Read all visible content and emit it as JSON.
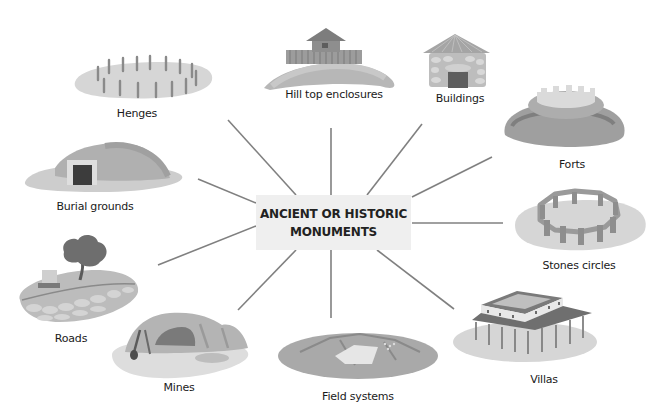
{
  "diagram": {
    "type": "spider-diagram",
    "center": {
      "line1": "ANCIENT OR HISTORIC",
      "line2": "MONUMENTS"
    },
    "colors": {
      "center_fill": "#efefef",
      "connector": "#808080",
      "ground_light": "#d9d9d9",
      "ground_mid": "#bdbdbd",
      "ground_dark": "#8c8c8c",
      "dark_accent": "#4a4a4a"
    },
    "nodes": [
      {
        "id": "henges",
        "label": "Henges",
        "icon": "henge-icon"
      },
      {
        "id": "hill-top-enclosures",
        "label": "Hill top enclosures",
        "icon": "hillfort-icon"
      },
      {
        "id": "buildings",
        "label": "Buildings",
        "icon": "roundhouse-icon"
      },
      {
        "id": "forts",
        "label": "Forts",
        "icon": "fort-icon"
      },
      {
        "id": "stones-circles",
        "label": "Stones circles",
        "icon": "stone-circle-icon"
      },
      {
        "id": "villas",
        "label": "Villas",
        "icon": "villa-icon"
      },
      {
        "id": "field-systems",
        "label": "Field systems",
        "icon": "field-icon"
      },
      {
        "id": "mines",
        "label": "Mines",
        "icon": "mine-icon"
      },
      {
        "id": "roads",
        "label": "Roads",
        "icon": "road-icon"
      },
      {
        "id": "burial-grounds",
        "label": "Burial grounds",
        "icon": "barrow-icon"
      }
    ]
  }
}
